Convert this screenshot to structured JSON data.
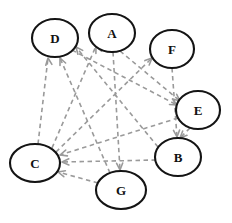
{
  "figure": {
    "kind": "directed-graph",
    "title": "",
    "background_color": "#ffffff",
    "node_stroke_color": "#141414",
    "node_fill_color": "#ffffff",
    "edge_color": "#9a9a9a",
    "edge_style": "dashed",
    "width": 232,
    "height": 223
  },
  "nodes": [
    {
      "id": "D",
      "label": "D",
      "cx": 55,
      "cy": 38,
      "rx": 23,
      "ry": 19
    },
    {
      "id": "A",
      "label": "A",
      "cx": 112,
      "cy": 33,
      "rx": 23,
      "ry": 19
    },
    {
      "id": "F",
      "label": "F",
      "cx": 172,
      "cy": 49,
      "rx": 22,
      "ry": 19
    },
    {
      "id": "E",
      "label": "E",
      "cx": 198,
      "cy": 110,
      "rx": 22,
      "ry": 19
    },
    {
      "id": "B",
      "label": "B",
      "cx": 178,
      "cy": 157,
      "rx": 23,
      "ry": 19
    },
    {
      "id": "G",
      "label": "G",
      "cx": 121,
      "cy": 190,
      "rx": 25,
      "ry": 19
    },
    {
      "id": "C",
      "label": "C",
      "cx": 35,
      "cy": 163,
      "rx": 25,
      "ry": 19
    }
  ],
  "edges": [
    {
      "from": "C",
      "to": "D",
      "path": "M 38 144 L 48 58",
      "head_at": [
        48,
        58
      ],
      "head_angle": 263
    },
    {
      "from": "G",
      "to": "D",
      "path": "M 110 173 L 60 58",
      "head_at": [
        60,
        58
      ],
      "head_angle": 246
    },
    {
      "from": "B",
      "to": "D",
      "path": "M 158 147 L 76 47",
      "head_at": [
        76,
        47
      ],
      "head_angle": 231
    },
    {
      "from": "C",
      "to": "A",
      "path": "M 52 148 L 96 46",
      "head_at": [
        96,
        46
      ],
      "head_angle": 247
    },
    {
      "from": "C",
      "to": "F",
      "path": "M 56 152 L 152 58",
      "head_at": [
        152,
        58
      ],
      "head_angle": 316
    },
    {
      "from": "A",
      "to": "E",
      "path": "M 120 51 L 180 101",
      "head_at": [
        180,
        101
      ],
      "head_angle": 40
    },
    {
      "from": "D",
      "to": "E",
      "path": "M 72 50 L 177 105",
      "head_at": [
        177,
        105
      ],
      "head_angle": 28
    },
    {
      "from": "F",
      "to": "B",
      "path": "M 172 68 L 177 137",
      "head_at": [
        177,
        137
      ],
      "head_angle": 86
    },
    {
      "from": "E",
      "to": "B",
      "path": "M 190 128 L 180 138",
      "head_at": [
        180,
        138
      ],
      "head_angle": 135
    },
    {
      "from": "A",
      "to": "G",
      "path": "M 113 52 L 120 170",
      "head_at": [
        120,
        170
      ],
      "head_angle": 87
    },
    {
      "from": "B",
      "to": "C",
      "path": "M 156 160 L 62 162",
      "head_at": [
        62,
        162
      ],
      "head_angle": 179
    },
    {
      "from": "E",
      "to": "C",
      "path": "M 178 118 L 60 155",
      "head_at": [
        60,
        155
      ],
      "head_angle": 163
    },
    {
      "from": "G",
      "to": "C",
      "path": "M 98 183 L 58 172",
      "head_at": [
        58,
        172
      ],
      "head_angle": 195
    }
  ]
}
